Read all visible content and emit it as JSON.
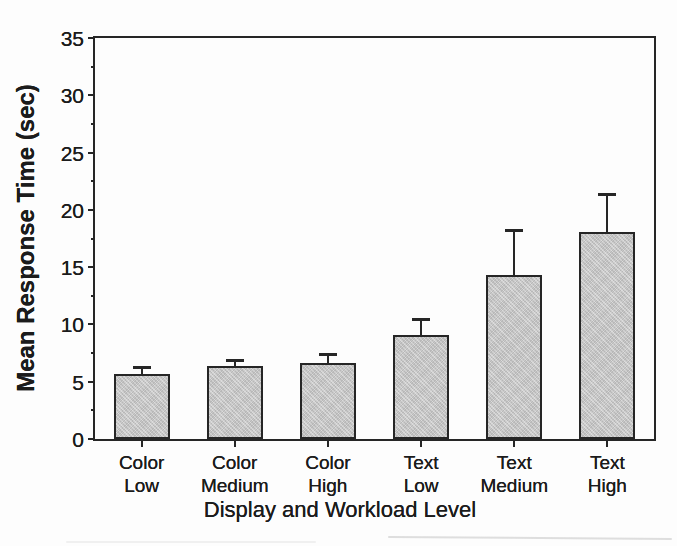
{
  "chart_data": {
    "type": "bar",
    "xlabel": "Display and Workload Level",
    "ylabel": "Mean Response Time (sec)",
    "categories": [
      "Color Low",
      "Color Medium",
      "Color High",
      "Text Low",
      "Text Medium",
      "Text High"
    ],
    "category_lines": [
      [
        "Color",
        "Low"
      ],
      [
        "Color",
        "Medium"
      ],
      [
        "Color",
        "High"
      ],
      [
        "Text",
        "Low"
      ],
      [
        "Text",
        "Medium"
      ],
      [
        "Text",
        "High"
      ]
    ],
    "values": [
      5.7,
      6.4,
      6.6,
      9.1,
      14.3,
      18.1
    ],
    "errors_upper": [
      0.6,
      0.5,
      0.8,
      1.4,
      3.9,
      3.3
    ],
    "ylim": [
      0,
      35
    ],
    "yticks": [
      0,
      5,
      10,
      15,
      20,
      25,
      30,
      35
    ],
    "minor_tick_interval": 2.5,
    "grid": false,
    "legend_position": "none",
    "bar_fill": "#c9c9c9",
    "bar_edge": "#262626",
    "axis_color": "#262626",
    "text_color": "#1c1c1c",
    "background": "#fdfdfd"
  }
}
